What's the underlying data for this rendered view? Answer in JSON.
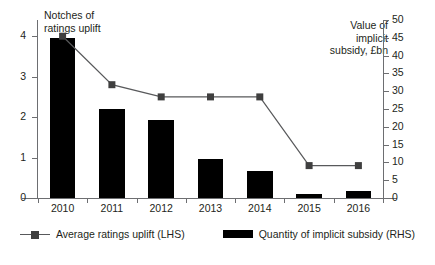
{
  "chart_data": {
    "type": "bar",
    "title": "",
    "categories": [
      "2010",
      "2011",
      "2012",
      "2013",
      "2014",
      "2015",
      "2016"
    ],
    "xlabel": "",
    "left_axis": {
      "label": "Notches of\nratings uplift",
      "ticks": [
        0,
        1,
        2,
        3,
        4
      ],
      "ylim": [
        0,
        4.4
      ],
      "tick_labels": [
        "0",
        "1",
        "2",
        "3",
        "4"
      ]
    },
    "right_axis": {
      "label": "Value of\nimplicit\nsubsidy, £bn",
      "ticks": [
        0,
        5,
        10,
        15,
        20,
        25,
        30,
        35,
        40,
        45,
        50
      ],
      "ylim": [
        0,
        50
      ],
      "tick_labels": [
        "0",
        "5",
        "10",
        "15",
        "20",
        "25",
        "30",
        "35",
        "40",
        "45",
        "50"
      ]
    },
    "grid": false,
    "legend_position": "bottom",
    "series": [
      {
        "name": "Average ratings uplift (LHS)",
        "type": "line",
        "axis": "left",
        "color": "#58595b",
        "marker": "square",
        "values": [
          4.0,
          2.8,
          2.5,
          2.5,
          2.5,
          0.8,
          0.8
        ]
      },
      {
        "name": "Quantity of implicit subsidy (RHS)",
        "type": "bar",
        "axis": "right",
        "color": "#000000",
        "values": [
          45,
          25,
          22,
          11,
          7.5,
          1,
          2
        ]
      }
    ]
  },
  "legend": {
    "items": [
      {
        "label": "Average ratings uplift (LHS)",
        "icon": "line-marker-swatch"
      },
      {
        "label": "Quantity of implicit subsidy (RHS)",
        "icon": "bar-swatch"
      }
    ]
  }
}
